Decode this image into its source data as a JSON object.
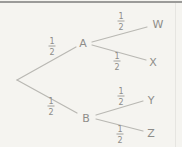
{
  "diagram": {
    "type": "probability-tree",
    "background": "#f5f4f0",
    "colors": {
      "line": "#b9b8b3",
      "text": "#8e8d89",
      "top_border": "#9b9b99",
      "right_border": "#e6e5e1"
    },
    "root": {
      "x": 17,
      "y": 80
    },
    "nodes": [
      {
        "id": "A",
        "label": "A",
        "x": 83,
        "y": 43
      },
      {
        "id": "B",
        "label": "B",
        "x": 86,
        "y": 118
      },
      {
        "id": "W",
        "label": "W",
        "x": 158,
        "y": 24
      },
      {
        "id": "X",
        "label": "X",
        "x": 153,
        "y": 62
      },
      {
        "id": "Y",
        "label": "Y",
        "x": 151,
        "y": 100
      },
      {
        "id": "Z",
        "label": "Z",
        "x": 151,
        "y": 133
      }
    ],
    "edges": [
      {
        "from": "root",
        "to": "A",
        "x1": 17,
        "y1": 80,
        "x2": 76,
        "y2": 47
      },
      {
        "from": "root",
        "to": "B",
        "x1": 17,
        "y1": 80,
        "x2": 77,
        "y2": 113
      },
      {
        "from": "A",
        "to": "W",
        "x1": 92,
        "y1": 42,
        "x2": 147,
        "y2": 27
      },
      {
        "from": "A",
        "to": "X",
        "x1": 92,
        "y1": 45,
        "x2": 146,
        "y2": 60
      },
      {
        "from": "B",
        "to": "Y",
        "x1": 96,
        "y1": 115,
        "x2": 143,
        "y2": 101
      },
      {
        "from": "B",
        "to": "Z",
        "x1": 96,
        "y1": 119,
        "x2": 143,
        "y2": 131
      }
    ],
    "probabilities": [
      {
        "edge": "root-A",
        "numerator": "1",
        "denominator": "2",
        "x": 52,
        "y": 46
      },
      {
        "edge": "root-B",
        "numerator": "1",
        "denominator": "2",
        "x": 51,
        "y": 106
      },
      {
        "edge": "A-W",
        "numerator": "1",
        "denominator": "2",
        "x": 121,
        "y": 21
      },
      {
        "edge": "A-X",
        "numerator": "1",
        "denominator": "2",
        "x": 117,
        "y": 61
      },
      {
        "edge": "B-Y",
        "numerator": "1",
        "denominator": "2",
        "x": 121,
        "y": 96
      },
      {
        "edge": "B-Z",
        "numerator": "1",
        "denominator": "2",
        "x": 120,
        "y": 134
      }
    ]
  }
}
